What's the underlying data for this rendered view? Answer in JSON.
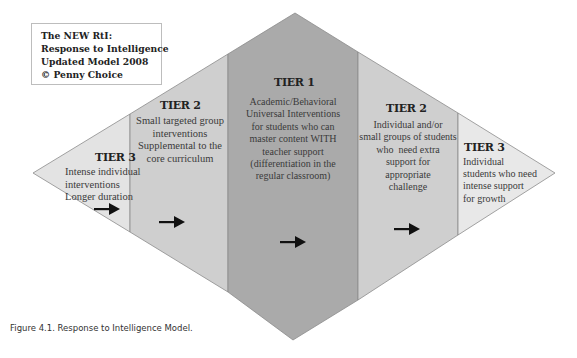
{
  "title_box": {
    "lines": [
      "The NEW RtI:",
      "Response to Intelligence",
      "Updated Model 2008",
      "© Penny Choice"
    ]
  },
  "colors": {
    "tier3_fill": "#e3e3e3",
    "tier2_fill": "#cfcfcf",
    "tier1_fill": "#aaaaaa",
    "edge": "#8c8c8c",
    "arrow": "#111111"
  },
  "sections": [
    {
      "id": "tier3-left",
      "heading": "TIER 3",
      "lines": [
        "Intense individual",
        "interventions",
        "Longer duration"
      ],
      "arrow": "right-arrow"
    },
    {
      "id": "tier2-left",
      "heading": "TIER 2",
      "lines": [
        "Small targeted group",
        "interventions",
        "Supplemental to the",
        "core curriculum"
      ],
      "arrow": "right-arrow"
    },
    {
      "id": "tier1",
      "heading": "TIER 1",
      "lines": [
        "Academic/Behavioral",
        "Universal Interventions",
        "for students who can",
        "master content WITH",
        "teacher support",
        "(differentiation in the",
        "regular classroom)"
      ],
      "arrow": "right-arrow"
    },
    {
      "id": "tier2-right",
      "heading": "TIER 2",
      "lines": [
        "Individual and/or",
        "small groups of students",
        "who  need extra",
        "support for",
        "appropriate",
        "challenge"
      ],
      "arrow": "right-arrow"
    },
    {
      "id": "tier3-right",
      "heading": "TIER 3",
      "lines": [
        "Individual",
        "students who need",
        "intense support",
        "for growth"
      ]
    }
  ],
  "caption": "Figure 4.1. Response to Intelligence Model."
}
